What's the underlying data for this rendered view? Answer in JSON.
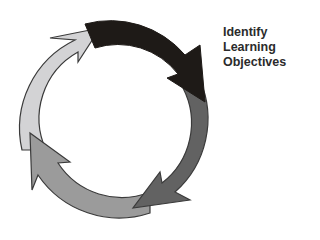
{
  "diagram": {
    "type": "cycle",
    "label_lines": [
      "Identify",
      "Learning",
      "Objectives"
    ],
    "arrows": [
      {
        "name": "dark",
        "color": "#1e1a17"
      },
      {
        "name": "dark-gray",
        "color": "#626262"
      },
      {
        "name": "medium-gray",
        "color": "#9b9b9b"
      },
      {
        "name": "light-gray",
        "color": "#d3d3d5"
      }
    ],
    "outline_color": "#3a3a3a"
  }
}
